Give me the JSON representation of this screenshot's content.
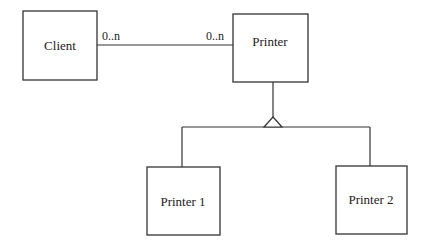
{
  "diagram": {
    "type": "UML class diagram",
    "classes": [
      {
        "id": "client",
        "name": "Client"
      },
      {
        "id": "printer",
        "name": "Printer"
      },
      {
        "id": "printer1",
        "name": "Printer 1"
      },
      {
        "id": "printer2",
        "name": "Printer 2"
      }
    ],
    "association": {
      "from": "client",
      "to": "printer",
      "from_multiplicity": "0..n",
      "to_multiplicity": "0..n"
    },
    "generalization": {
      "parent": "printer",
      "children": [
        "printer1",
        "printer2"
      ]
    }
  }
}
